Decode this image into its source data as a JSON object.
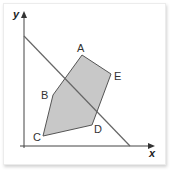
{
  "diagram": {
    "axes": {
      "x_label": "x",
      "y_label": "y"
    },
    "vertices": [
      {
        "name": "A",
        "x": 82,
        "y": 55,
        "lx": 77,
        "ly": 52
      },
      {
        "name": "E",
        "x": 111,
        "y": 74,
        "lx": 114,
        "ly": 80
      },
      {
        "name": "D",
        "x": 92,
        "y": 125,
        "lx": 94,
        "ly": 133
      },
      {
        "name": "C",
        "x": 43,
        "y": 136,
        "lx": 33,
        "ly": 141
      },
      {
        "name": "B",
        "x": 53,
        "y": 95,
        "lx": 41,
        "ly": 99
      }
    ],
    "polygon_fill": "#c8c8c8",
    "polygon_stroke": "#555555",
    "line": {
      "x1": 24,
      "y1": 36,
      "x2": 130,
      "y2": 146,
      "color": "#666666"
    }
  }
}
